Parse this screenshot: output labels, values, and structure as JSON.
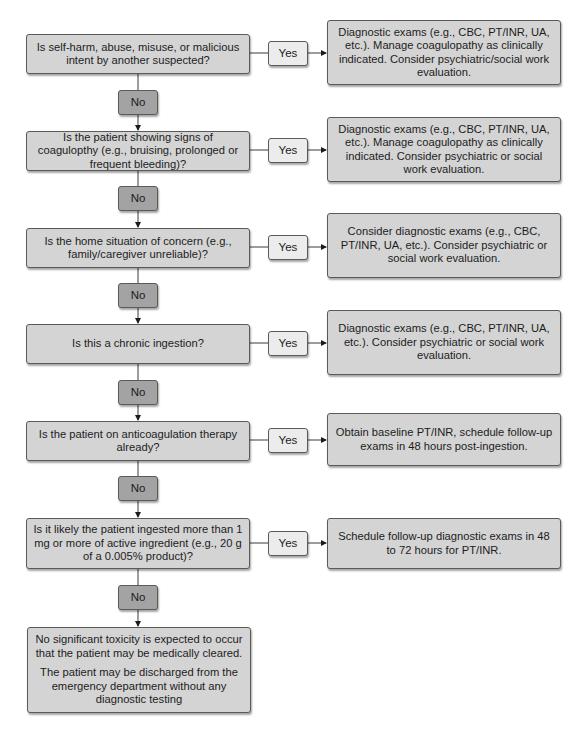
{
  "flowchart": {
    "steps": [
      {
        "question": "Is self-harm, abuse, misuse, or malicious intent by another suspected?",
        "yes_label": "Yes",
        "no_label": "No",
        "yes_action": "Diagnostic exams (e.g., CBC, PT/INR, UA, etc.). Manage coagulopathy as clinically indicated. Consider psychiatric/social work evaluation."
      },
      {
        "question": "Is the patient showing signs of coagulopthy (e.g., bruising, prolonged or frequent bleeding)?",
        "yes_label": "Yes",
        "no_label": "No",
        "yes_action": "Diagnostic exams (e.g., CBC, PT/INR, UA, etc.). Manage coagulopathy as clinically indicated. Consider psychiatric or social work evaluation."
      },
      {
        "question": "Is the home situation of concern (e.g., family/caregiver unreliable)?",
        "yes_label": "Yes",
        "no_label": "No",
        "yes_action": "Consider diagnostic exams (e.g., CBC, PT/INR, UA, etc.). Consider psychiatric or social work evaluation."
      },
      {
        "question": "Is this a chronic ingestion?",
        "yes_label": "Yes",
        "no_label": "No",
        "yes_action": "Diagnostic exams (e.g., CBC, PT/INR, UA, etc.). Consider psychiatric or social work evaluation."
      },
      {
        "question": "Is the patient on anticoagulation therapy already?",
        "yes_label": "Yes",
        "no_label": "No",
        "yes_action": "Obtain baseline PT/INR, schedule follow-up exams in 48 hours post-ingestion."
      },
      {
        "question": "Is it likely the patient ingested more than 1 mg or more of active ingredient (e.g., 20 g of a 0.005% product)?",
        "yes_label": "Yes",
        "no_label": "No",
        "yes_action": "Schedule follow-up diagnostic exams in 48 to 72 hours for PT/INR."
      }
    ],
    "final": {
      "line1": "No significant toxicity is expected to occur that the patient may be medically cleared.",
      "line2": "The patient may be discharged from the emergency department without any diagnostic testing"
    },
    "colors": {
      "question_fill": "#d4d4d4",
      "yes_fill": "#ececec",
      "no_fill": "#a3a3a3",
      "action_fill": "#d4d4d4",
      "border": "#5a5a5a"
    }
  }
}
